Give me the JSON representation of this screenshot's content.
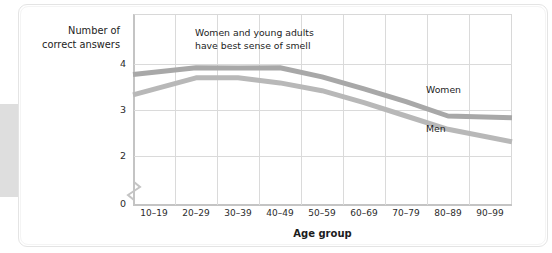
{
  "chart_data": {
    "type": "line",
    "title": "",
    "xlabel": "Age group",
    "ylabel": "Number of correct answers",
    "categories": [
      "10–19",
      "20–29",
      "30–39",
      "40–49",
      "50–59",
      "60–69",
      "70–79",
      "80–89",
      "90–99"
    ],
    "series": [
      {
        "name": "Women",
        "values": [
          3.77,
          3.92,
          3.91,
          3.92,
          3.72,
          3.46,
          3.18,
          2.87,
          2.83
        ],
        "color": "#a8a8a8"
      },
      {
        "name": "Men",
        "values": [
          3.33,
          3.7,
          3.7,
          3.59,
          3.42,
          3.16,
          2.87,
          2.58,
          2.31
        ],
        "color": "#b8b8b8"
      }
    ],
    "y_ticks": [
      "0",
      "2",
      "3",
      "4"
    ],
    "ylim": [
      2,
      4.3
    ],
    "y_axis_break": true,
    "grid": true,
    "legend_position": "inline-right",
    "annotations": [
      {
        "text": "Women and young adults\nhave best sense of smell"
      }
    ]
  },
  "axis_titles": {
    "y": "Number of\ncorrect answers",
    "x": "Age group"
  },
  "y_tick_labels": {
    "t4": "4",
    "t3": "3",
    "t2": "2",
    "t0": "0"
  },
  "x_tick_labels": [
    "10–19",
    "20–29",
    "30–39",
    "40–49",
    "50–59",
    "60–69",
    "70–79",
    "80–89",
    "90–99"
  ],
  "annotation_text": "Women and young adults\nhave best sense of smell",
  "series_labels": {
    "women": "Women",
    "men": "Men"
  },
  "colors": {
    "women_line": "#a9a9a9",
    "men_line": "#bcbcbc",
    "grid": "#dadada",
    "axis": "#c4c4c4",
    "text": "#1c1c1c",
    "card_background": "#ffffff",
    "card_border": "#e4e4e4"
  }
}
